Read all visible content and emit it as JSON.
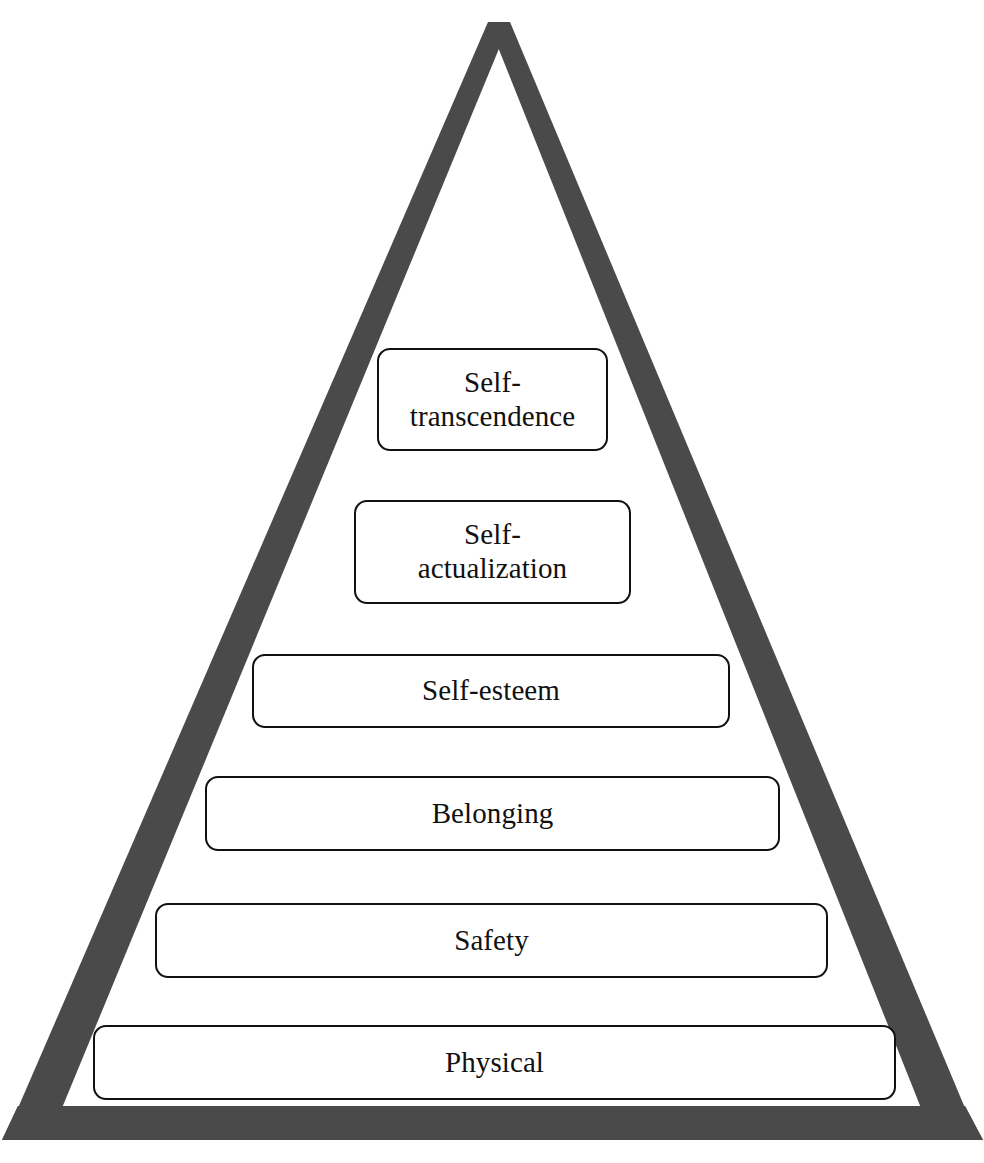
{
  "diagram": {
    "shape": "triangle",
    "stroke_color": "#4a4a4a",
    "base_bar_color": "#4a4a4a",
    "background_color": "#ffffff",
    "box_border_color": "#111111",
    "box_fill_color": "#ffffff"
  },
  "levels": [
    {
      "index": 1,
      "label": "Self-\ntranscendence",
      "label_plain": "Self-transcendence",
      "x": 377,
      "y": 348,
      "width": 231,
      "height": 103,
      "font_size": 29
    },
    {
      "index": 2,
      "label": "Self-\nactualization",
      "label_plain": "Self-actualization",
      "x": 354,
      "y": 500,
      "width": 277,
      "height": 104,
      "font_size": 29
    },
    {
      "index": 3,
      "label": "Self-esteem",
      "label_plain": "Self-esteem",
      "x": 252,
      "y": 654,
      "width": 478,
      "height": 74,
      "font_size": 29
    },
    {
      "index": 4,
      "label": "Belonging",
      "label_plain": "Belonging",
      "x": 205,
      "y": 776,
      "width": 575,
      "height": 75,
      "font_size": 29
    },
    {
      "index": 5,
      "label": "Safety",
      "label_plain": "Safety",
      "x": 155,
      "y": 903,
      "width": 673,
      "height": 75,
      "font_size": 29
    },
    {
      "index": 6,
      "label": "Physical",
      "label_plain": "Physical",
      "x": 93,
      "y": 1025,
      "width": 803,
      "height": 75,
      "font_size": 29
    }
  ],
  "chart_data": {
    "type": "pyramid",
    "categories": [
      "Self-transcendence",
      "Self-actualization",
      "Self-esteem",
      "Belonging",
      "Safety",
      "Physical"
    ],
    "order": "top-to-bottom",
    "levels": 6
  }
}
